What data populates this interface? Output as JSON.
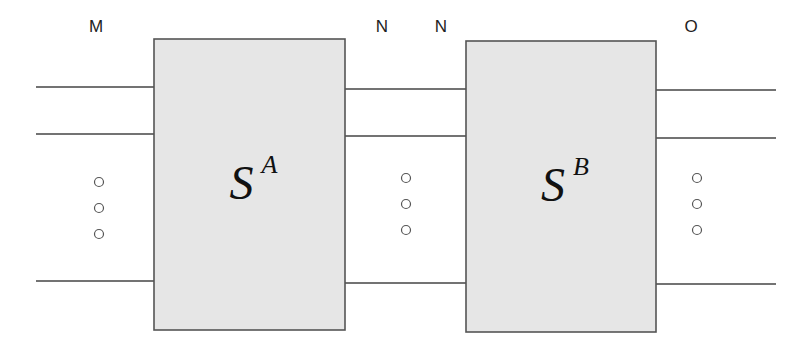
{
  "diagram": {
    "title": "",
    "colors": {
      "background": "#ffffff",
      "block_fill": "#e6e6e6",
      "block_stroke": "#555555",
      "wire": "#444444",
      "dot_stroke": "#555555",
      "text": "#222222"
    },
    "port_labels": [
      {
        "id": "M",
        "text": "M",
        "x": 96,
        "y": 32
      },
      {
        "id": "N-left",
        "text": "N",
        "x": 382,
        "y": 32
      },
      {
        "id": "N-right",
        "text": "N",
        "x": 441,
        "y": 32
      },
      {
        "id": "O",
        "text": "O",
        "x": 691,
        "y": 32
      }
    ],
    "blocks": [
      {
        "id": "SA",
        "symbol": "S",
        "superscript": "A",
        "x": 154,
        "y": 39,
        "width": 191,
        "height": 291
      },
      {
        "id": "SB",
        "symbol": "S",
        "superscript": "B",
        "x": 466,
        "y": 41,
        "width": 190,
        "height": 291
      }
    ],
    "wire_groups": [
      {
        "id": "input-M",
        "x1": 36,
        "x2": 154,
        "ys": [
          87,
          134,
          281
        ]
      },
      {
        "id": "between-N",
        "x1": 345,
        "x2": 466,
        "ys": [
          89,
          136,
          283
        ]
      },
      {
        "id": "output-O",
        "x1": 656,
        "x2": 776,
        "ys": [
          90,
          138,
          284
        ]
      }
    ],
    "ellipsis_dots": [
      {
        "group": "M",
        "x": 99,
        "ys": [
          182,
          208,
          234
        ]
      },
      {
        "group": "N",
        "x": 406,
        "ys": [
          178,
          204,
          230
        ]
      },
      {
        "group": "O",
        "x": 697,
        "ys": [
          178,
          204,
          230
        ]
      }
    ]
  }
}
